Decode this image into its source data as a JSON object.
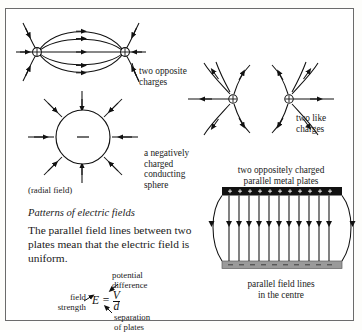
{
  "figure": {
    "kind": "textbook-diagram",
    "topic": "Patterns of electric fields",
    "ink_color": "#111111",
    "plate_positive_color": "#111111",
    "plate_negative_color": "#9a9a9a",
    "border_color": "#6b6b6b"
  },
  "captions": {
    "dipole": "two opposite\ncharges",
    "like_charges": "two like\ncharges",
    "sphere": "a negatively\ncharged\nconducting\nsphere",
    "radial_field": "(radial field)",
    "plates": "two oppositely charged\nparallel metal plates",
    "parallel_lines": "parallel field lines\nin the centre"
  },
  "heading": "Patterns of electric fields",
  "body_text": "The parallel field lines between two plates mean that the electric field is uniform.",
  "formula": {
    "equation_lhs": "E",
    "equals": "=",
    "numerator": "V",
    "denominator": "d",
    "label_field_strength": "field\nstrength",
    "label_potential_difference": "potential\ndifference",
    "label_separation": "separation\nof plates"
  },
  "symbols": {
    "positive_charge": "+",
    "negative_charge": "−",
    "plate_positive_marks": "+",
    "plate_negative_marks": "−"
  },
  "diagrams": {
    "dipole": {
      "name": "two-opposite-charges",
      "charge_markers": 2,
      "inner_curved_lines": 5,
      "outer_lines": 6
    },
    "sphere": {
      "name": "negatively-charged-sphere",
      "radial_lines": 8,
      "centre_sign": "−",
      "arrow_direction": "inward"
    },
    "like_charges": {
      "name": "two-like-charges",
      "charges": 2,
      "lines_per_charge": 6,
      "arrow_direction": "outward"
    },
    "plates": {
      "name": "parallel-plate-field",
      "field_lines": 12,
      "top_plate_charge": "+",
      "bottom_plate_charge": "−",
      "plate_marks": 11
    }
  }
}
